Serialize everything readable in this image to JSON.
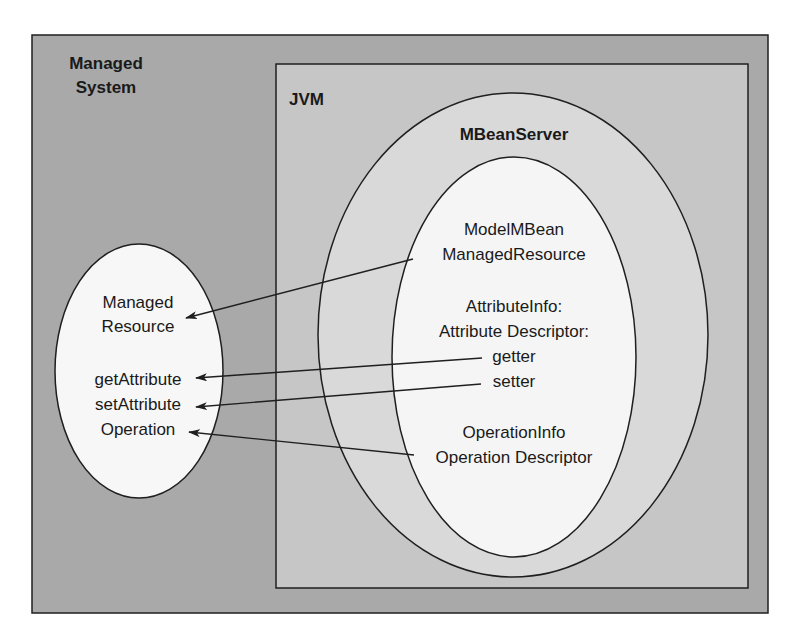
{
  "colors": {
    "managed_system_fill": "#a9a9a9",
    "jvm_fill": "#c6c6c6",
    "mbeanserver_fill": "#d9d9d9",
    "modelmbean_fill": "#f5f5f5",
    "managed_resource_fill": "#f7f7f7",
    "stroke": "#1f1f1f"
  },
  "managed_system": {
    "title_line1": "Managed",
    "title_line2": "System"
  },
  "jvm": {
    "title": "JVM"
  },
  "mbean_server": {
    "title": "MBeanServer"
  },
  "model_mbean": {
    "line1": "ModelMBean",
    "line2": "ManagedResource",
    "attr_line1": "AttributeInfo:",
    "attr_line2": "Attribute Descriptor:",
    "getter": "getter",
    "setter": "setter",
    "op_line1": "OperationInfo",
    "op_line2": "Operation Descriptor"
  },
  "managed_resource": {
    "line1": "Managed",
    "line2": "Resource",
    "get_attribute": "getAttribute",
    "set_attribute": "setAttribute",
    "operation": "Operation"
  },
  "connections": [
    {
      "from": "ModelMBean ManagedResource",
      "to": "Managed Resource"
    },
    {
      "from": "getter",
      "to": "getAttribute"
    },
    {
      "from": "setter",
      "to": "setAttribute"
    },
    {
      "from": "Operation Descriptor",
      "to": "Operation"
    }
  ]
}
